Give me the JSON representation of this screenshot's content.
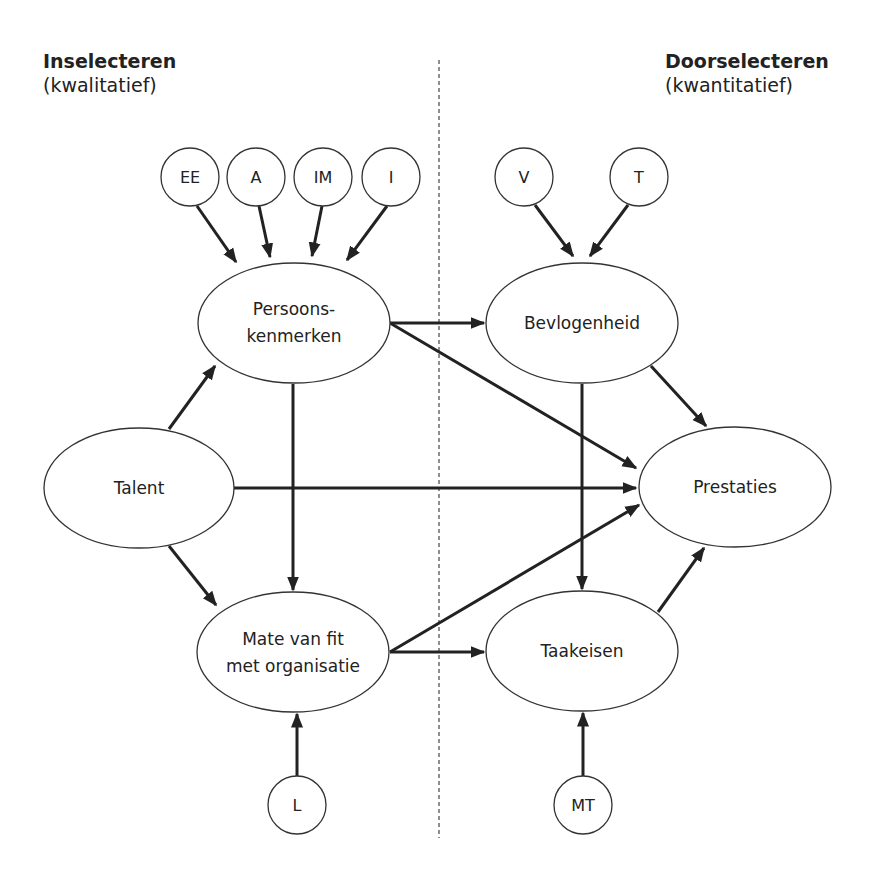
{
  "headings": {
    "left": {
      "title": "Inselecteren",
      "subtitle": "(kwalitatief)"
    },
    "right": {
      "title": "Doorselecteren",
      "subtitle": "(kwantitatief)"
    }
  },
  "nodes": {
    "EE": {
      "label": "EE"
    },
    "A": {
      "label": "A"
    },
    "IM": {
      "label": "IM"
    },
    "I": {
      "label": "I"
    },
    "V": {
      "label": "V"
    },
    "T": {
      "label": "T"
    },
    "L": {
      "label": "L"
    },
    "MT": {
      "label": "MT"
    },
    "persoonskenmerken": {
      "line1": "Persoons-",
      "line2": "kenmerken"
    },
    "bevlogenheid": {
      "label": "Bevlogenheid"
    },
    "talent": {
      "label": "Talent"
    },
    "prestaties": {
      "label": "Prestaties"
    },
    "mate_van_fit": {
      "line1": "Mate van fit",
      "line2": "met organisatie"
    },
    "taakeisen": {
      "label": "Taakeisen"
    }
  },
  "edges": [
    {
      "from": "EE",
      "to": "Persoonskenmerken"
    },
    {
      "from": "A",
      "to": "Persoonskenmerken"
    },
    {
      "from": "IM",
      "to": "Persoonskenmerken"
    },
    {
      "from": "I",
      "to": "Persoonskenmerken"
    },
    {
      "from": "V",
      "to": "Bevlogenheid"
    },
    {
      "from": "T",
      "to": "Bevlogenheid"
    },
    {
      "from": "Talent",
      "to": "Persoonskenmerken"
    },
    {
      "from": "Talent",
      "to": "Prestaties"
    },
    {
      "from": "Talent",
      "to": "Mate van fit met organisatie"
    },
    {
      "from": "Persoonskenmerken",
      "to": "Bevlogenheid"
    },
    {
      "from": "Persoonskenmerken",
      "to": "Prestaties"
    },
    {
      "from": "Persoonskenmerken",
      "to": "Mate van fit met organisatie"
    },
    {
      "from": "Bevlogenheid",
      "to": "Prestaties"
    },
    {
      "from": "Bevlogenheid",
      "to": "Taakeisen"
    },
    {
      "from": "Mate van fit met organisatie",
      "to": "Prestaties"
    },
    {
      "from": "Mate van fit met organisatie",
      "to": "Taakeisen"
    },
    {
      "from": "Taakeisen",
      "to": "Prestaties"
    },
    {
      "from": "L",
      "to": "Mate van fit met organisatie"
    },
    {
      "from": "MT",
      "to": "Taakeisen"
    }
  ],
  "colors": {
    "stroke": "#222222",
    "background": "#ffffff"
  }
}
